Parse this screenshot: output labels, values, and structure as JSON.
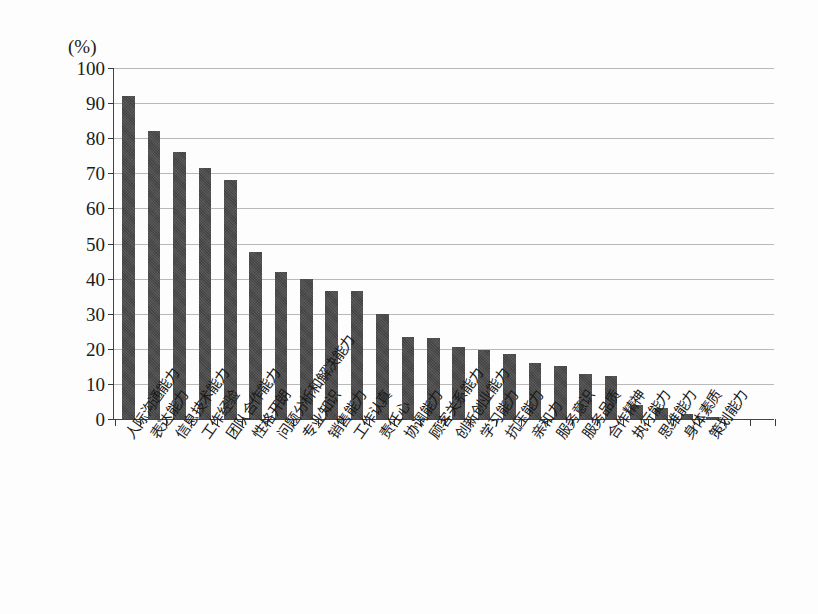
{
  "chart_data": {
    "type": "bar",
    "title": "",
    "subtitle": "",
    "xlabel": "",
    "ylabel": "(%)",
    "unit_label": "(%)",
    "ylim": [
      0,
      100
    ],
    "ytick_step": 10,
    "grid": true,
    "legend": "none",
    "bar_color": "#4a4a4a",
    "categories": [
      "人际沟通能力",
      "表达能力",
      "信息技术能力",
      "工作经验",
      "团队合作能力",
      "性格开朗",
      "问题分析和解决能力",
      "专业知识",
      "销售能力",
      "工作认真",
      "责任心",
      "协调能力",
      "顾客关系能力",
      "创新创业能力",
      "学习能力",
      "抗压能力",
      "亲和力",
      "服务意识",
      "服务品质",
      "合作精神",
      "执行能力",
      "思维能力",
      "身体素质",
      "策划能力"
    ],
    "values": [
      92,
      82,
      76,
      71.5,
      68,
      47.5,
      42,
      40,
      36.5,
      36.5,
      30,
      23.5,
      23,
      20.5,
      19.7,
      18.5,
      16,
      15,
      12.8,
      12.2,
      4,
      3.2,
      1.3,
      0.5
    ],
    "ytick_labels": [
      "0",
      "10",
      "20",
      "30",
      "40",
      "50",
      "60",
      "70",
      "80",
      "90",
      "100"
    ],
    "ytick_values": [
      0,
      10,
      20,
      30,
      40,
      50,
      60,
      70,
      80,
      90,
      100
    ]
  }
}
